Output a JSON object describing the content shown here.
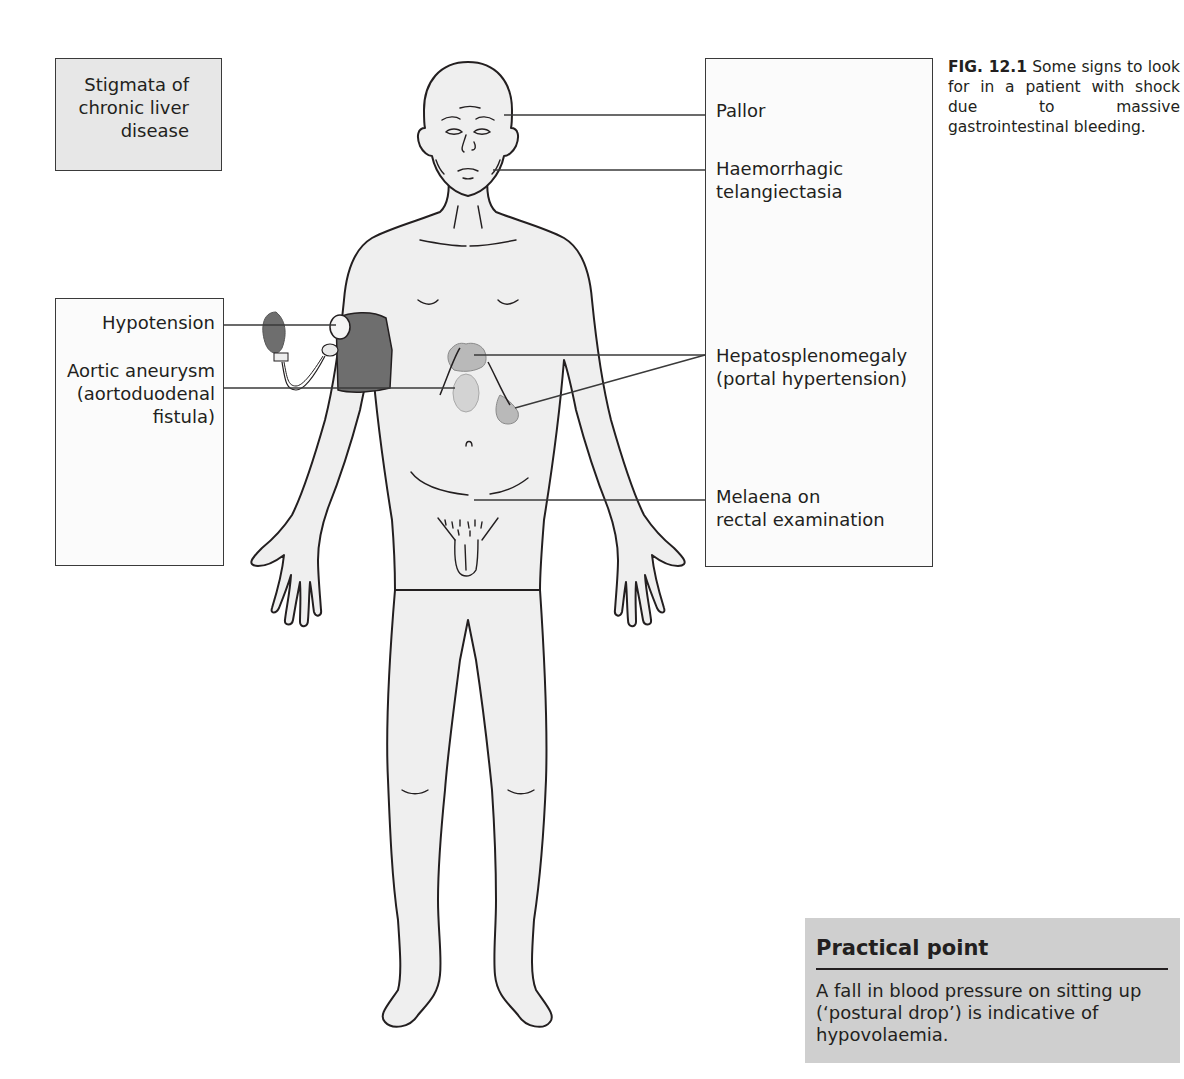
{
  "figure": {
    "caption_label": "FIG. 12.1",
    "caption_text": " Some signs to look for in a patient with shock due to massive gastrointestinal bleeding."
  },
  "boxes": {
    "stigmata": {
      "lines": [
        "Stigmata of",
        "chronic liver",
        "disease"
      ]
    },
    "left": {
      "items": [
        {
          "lines": [
            "Hypotension"
          ]
        },
        {
          "lines": [
            "Aortic aneurysm",
            "(aortoduodenal",
            "fistula)"
          ]
        }
      ]
    },
    "right": {
      "items": [
        {
          "lines": [
            "Pallor"
          ]
        },
        {
          "lines": [
            "Haemorrhagic",
            "telangiectasia"
          ]
        },
        {
          "lines": [
            "Hepatosplenomegaly",
            "(portal hypertension)"
          ]
        },
        {
          "lines": [
            "Melaena on",
            "rectal examination"
          ]
        }
      ]
    }
  },
  "practical_point": {
    "title": "Practical point",
    "body": "A fall in blood pressure on sitting up (‘postural drop’) is indicative of hypovolaemia."
  },
  "colors": {
    "stigmata_fill": "#e7e7e7",
    "practical_fill": "#cfcfcf",
    "body_fill": "#efefef",
    "organ_fill": "#b9b9b9",
    "cuff_fill": "#6e6e6e",
    "outline": "#231f20"
  }
}
